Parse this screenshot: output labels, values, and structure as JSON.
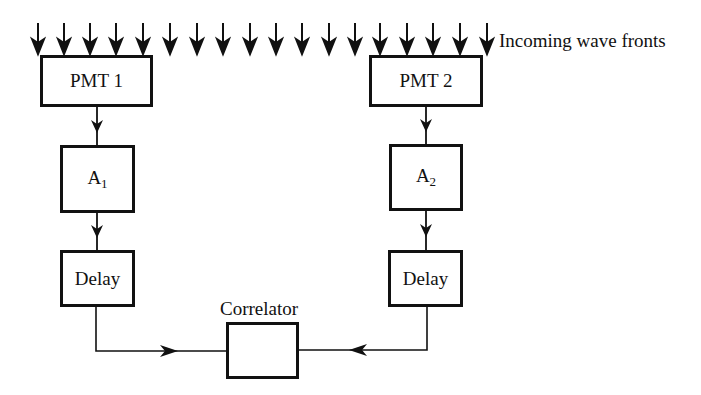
{
  "diagram": {
    "type": "block-diagram",
    "title": "",
    "wave_label": "Incoming wave fronts",
    "wave_arrow_count": 18,
    "wave_arrow_x": [
      38,
      64,
      90,
      116,
      143,
      170,
      197,
      223,
      250,
      276,
      302,
      329,
      355,
      380,
      407,
      433,
      460,
      487
    ],
    "nodes": {
      "pmt1": {
        "label": "PMT 1"
      },
      "pmt2": {
        "label": "PMT 2"
      },
      "a1": {
        "label": "A",
        "sub": "1"
      },
      "a2": {
        "label": "A",
        "sub": "2"
      },
      "delay1": {
        "label": "Delay"
      },
      "delay2": {
        "label": "Delay"
      },
      "correlator": {
        "label": "Correlator"
      }
    },
    "edges": [
      {
        "from": "wave",
        "to": "pmt1"
      },
      {
        "from": "wave",
        "to": "pmt2"
      },
      {
        "from": "pmt1",
        "to": "a1"
      },
      {
        "from": "a1",
        "to": "delay1"
      },
      {
        "from": "delay1",
        "to": "correlator"
      },
      {
        "from": "pmt2",
        "to": "a2"
      },
      {
        "from": "a2",
        "to": "delay2"
      },
      {
        "from": "delay2",
        "to": "correlator"
      }
    ]
  }
}
